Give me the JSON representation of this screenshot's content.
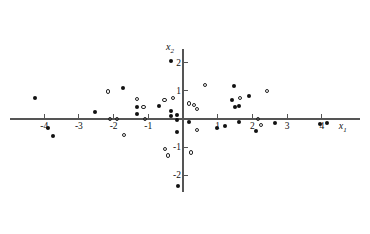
{
  "chart_data": {
    "type": "scatter",
    "title": "",
    "xlabel": "x1",
    "ylabel": "x2",
    "xlabel_display": "x",
    "xlabel_sub": "1",
    "ylabel_display": "x",
    "ylabel_sub": "2",
    "xlim": [
      -5.0,
      5.1
    ],
    "ylim": [
      -2.6,
      2.5
    ],
    "grid": false,
    "legend": "none",
    "axes_style": "crossed-at-origin",
    "xticks": [
      -4,
      -3,
      -2,
      -1,
      1,
      2,
      3,
      4
    ],
    "xtick_labels": [
      "-4",
      "-3",
      "-2",
      "-1",
      "1",
      "2",
      "3",
      "4"
    ],
    "yticks": [
      2,
      1,
      -1,
      -2
    ],
    "ytick_labels": [
      "2",
      "1",
      "-1",
      "-2"
    ],
    "series": [
      {
        "name": "filled",
        "marker": "filled-circle",
        "color": "#111111",
        "points": [
          [
            -4.26,
            0.75
          ],
          [
            -3.89,
            -0.32
          ],
          [
            -3.75,
            -0.61
          ],
          [
            -2.54,
            0.25
          ],
          [
            -1.73,
            1.11
          ],
          [
            -1.33,
            0.43
          ],
          [
            -1.33,
            0.18
          ],
          [
            -0.69,
            0.46
          ],
          [
            -0.35,
            2.07
          ],
          [
            -0.35,
            0.29
          ],
          [
            -0.35,
            0.11
          ],
          [
            -0.17,
            0.14
          ],
          [
            -0.17,
            -0.04
          ],
          [
            -0.17,
            -0.46
          ],
          [
            -0.14,
            -2.39
          ],
          [
            0.17,
            -0.11
          ],
          [
            0.98,
            -0.32
          ],
          [
            1.21,
            -0.25
          ],
          [
            1.41,
            0.68
          ],
          [
            1.47,
            1.18
          ],
          [
            1.5,
            0.43
          ],
          [
            1.61,
            0.46
          ],
          [
            1.61,
            -0.11
          ],
          [
            1.9,
            0.82
          ],
          [
            2.1,
            -0.43
          ],
          [
            2.65,
            -0.14
          ],
          [
            3.95,
            -0.18
          ],
          [
            4.15,
            -0.14
          ]
        ]
      },
      {
        "name": "open",
        "marker": "open-circle",
        "color": "#222222",
        "points": [
          [
            -2.16,
            0.98
          ],
          [
            -2.1,
            0.0
          ],
          [
            -1.9,
            0.0
          ],
          [
            -1.7,
            -0.57
          ],
          [
            -1.33,
            0.71
          ],
          [
            -1.13,
            0.43
          ],
          [
            -1.1,
            0.0
          ],
          [
            -0.54,
            0.68
          ],
          [
            -0.52,
            -1.07
          ],
          [
            -0.43,
            -1.29
          ],
          [
            -0.29,
            0.75
          ],
          [
            0.17,
            0.54
          ],
          [
            0.23,
            -1.18
          ],
          [
            0.32,
            0.5
          ],
          [
            0.4,
            0.36
          ],
          [
            0.4,
            -0.39
          ],
          [
            0.63,
            1.21
          ],
          [
            1.64,
            0.75
          ],
          [
            2.16,
            0.0
          ],
          [
            2.25,
            -0.21
          ],
          [
            2.42,
            1.0
          ]
        ]
      }
    ]
  },
  "caption": ""
}
